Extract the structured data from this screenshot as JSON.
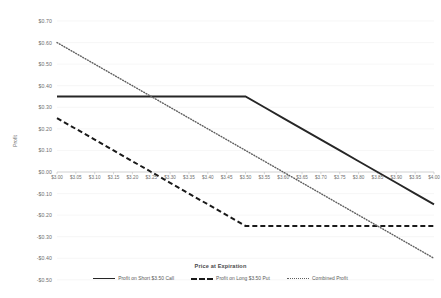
{
  "chart_data": {
    "type": "line",
    "title": "Price at Expiration",
    "xlabel": "Price at Expiration",
    "ylabel": "Profit",
    "x": [
      3.0,
      3.05,
      3.1,
      3.15,
      3.2,
      3.25,
      3.3,
      3.35,
      3.4,
      3.45,
      3.5,
      3.55,
      3.6,
      3.65,
      3.7,
      3.75,
      3.8,
      3.85,
      3.9,
      3.95,
      4.0
    ],
    "xlim": [
      3.0,
      4.0
    ],
    "ylim": [
      -0.5,
      0.7
    ],
    "grid": true,
    "legend_position": "bottom",
    "xticklabels": [
      "$3.00",
      "$3.05",
      "$3.10",
      "$3.15",
      "$3.20",
      "$3.25",
      "$3.30",
      "$3.35",
      "$3.40",
      "$3.45",
      "$3.50",
      "$3.55",
      "$3.60",
      "$3.65",
      "$3.70",
      "$3.75",
      "$3.80",
      "$3.85",
      "$3.90",
      "$3.95",
      "$4.00"
    ],
    "yticklabels": [
      "$0.70",
      "$0.60",
      "$0.50",
      "$0.40",
      "$0.30",
      "$0.20",
      "$0.10",
      "$0.00",
      "-$0.10",
      "-$0.20",
      "-$0.30",
      "-$0.40",
      "-$0.50"
    ],
    "yticks": [
      0.7,
      0.6,
      0.5,
      0.4,
      0.3,
      0.2,
      0.1,
      0.0,
      -0.1,
      -0.2,
      -0.3,
      -0.4,
      -0.5
    ],
    "series": [
      {
        "name": "Profit on Short $3.50 Call",
        "style": "solid",
        "color": "#262626",
        "values": [
          0.35,
          0.35,
          0.35,
          0.35,
          0.35,
          0.35,
          0.35,
          0.35,
          0.35,
          0.35,
          0.35,
          0.3,
          0.25,
          0.2,
          0.15,
          0.1,
          0.05,
          0.0,
          -0.05,
          -0.1,
          -0.15
        ]
      },
      {
        "name": "Profit on Long $3.50 Put",
        "style": "dashed",
        "color": "#1a1a1a",
        "values": [
          0.25,
          0.2,
          0.15,
          0.1,
          0.05,
          0.0,
          -0.05,
          -0.1,
          -0.15,
          -0.2,
          -0.25,
          -0.25,
          -0.25,
          -0.25,
          -0.25,
          -0.25,
          -0.25,
          -0.25,
          -0.25,
          -0.25,
          -0.25
        ]
      },
      {
        "name": "Combined Profit",
        "style": "dotted",
        "color": "#5f5f5f",
        "values": [
          0.6,
          0.55,
          0.5,
          0.45,
          0.4,
          0.35,
          0.3,
          0.25,
          0.2,
          0.15,
          0.1,
          0.05,
          0.0,
          -0.05,
          -0.1,
          -0.15,
          -0.2,
          -0.25,
          -0.3,
          -0.35,
          -0.4
        ]
      }
    ]
  },
  "legend": {
    "items": [
      {
        "label": "Profit on Short $3.50 Call"
      },
      {
        "label": "Profit on Long $3.50 Put"
      },
      {
        "label": "Combined Profit"
      }
    ]
  },
  "axes": {
    "x_title": "Price at Expiration",
    "y_title": "Profit"
  }
}
